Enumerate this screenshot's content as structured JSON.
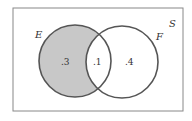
{
  "diagram": {
    "type": "venn",
    "universe_label": "S",
    "sets": [
      {
        "label": "E",
        "shaded": true
      },
      {
        "label": "F",
        "shaded": false
      }
    ],
    "regions": {
      "E_only": ".3",
      "E_and_F": ".1",
      "F_only": ".4"
    },
    "colors": {
      "shade": "#c8c8c8",
      "stroke": "#555555",
      "frame": "#888888"
    }
  }
}
